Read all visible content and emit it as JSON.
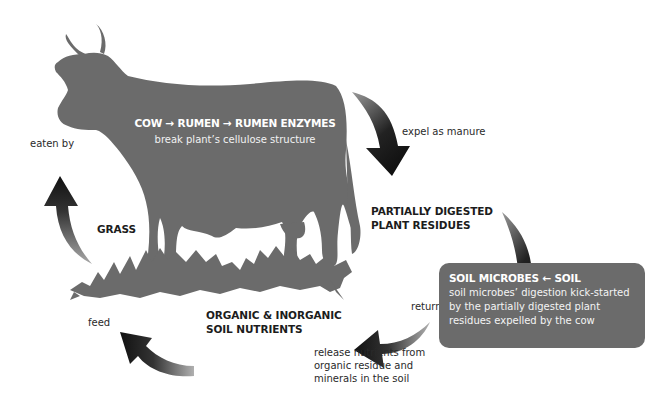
{
  "diagram": {
    "cow": {
      "title": "COW → RUMEN → RUMEN ENZYMES",
      "subtitle": "break plant’s cellulose structure",
      "color": "#6b6b6b"
    },
    "nodes": {
      "partially_digested": {
        "line1": "PARTIALLY DIGESTED",
        "line2": "PLANT RESIDUES"
      },
      "soil_microbes": {
        "title": "SOIL MICROBES ← SOIL",
        "line1": "soil microbes’ digestion kick-started",
        "line2": "by the partially digested plant",
        "line3": "residues expelled by the cow",
        "color": "#6b6b6b"
      },
      "nutrients": {
        "line1": "ORGANIC & INORGANIC",
        "line2": "SOIL NUTRIENTS"
      },
      "grass": {
        "label": "GRASS"
      }
    },
    "edges": {
      "expel": "expel as manure",
      "return": "return to the soil",
      "release": {
        "line1": "release nutrients from",
        "line2": "organic residue and",
        "line3": "minerals in the soil"
      },
      "feed": "feed",
      "eaten": "eaten by"
    },
    "colors": {
      "arrow_dark": "#111111",
      "arrow_light": "#9a9a9a",
      "silhouette": "#6b6b6b"
    }
  }
}
